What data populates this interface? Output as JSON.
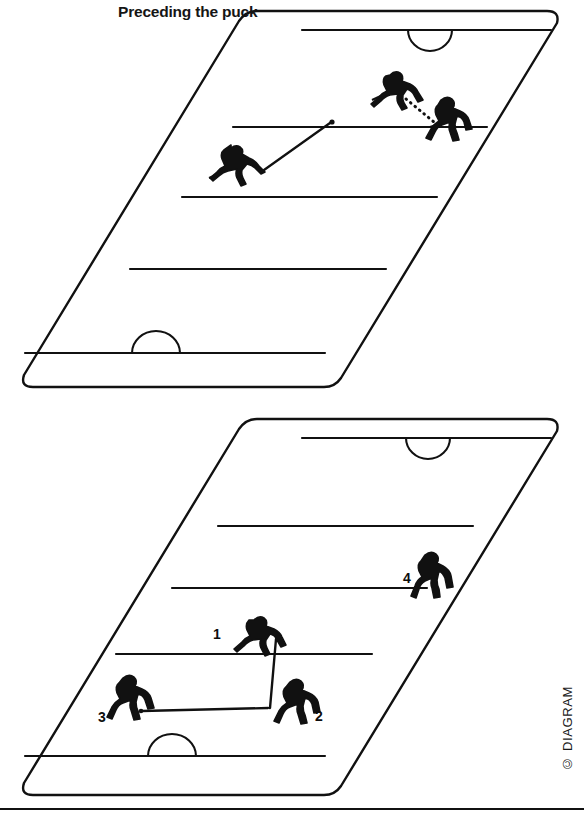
{
  "document": {
    "kind": "instructional-diagram",
    "subject": "ice hockey positional play",
    "background_color": "#ffffff",
    "ink_color": "#111111",
    "footer_rule": true
  },
  "panels": [
    {
      "id": "preceding",
      "title": "Preceding the puck",
      "rink": {
        "shape": "oblique-parallelogram",
        "corners": {
          "top_left": [
            300,
            12
          ],
          "top_right": [
            558,
            12
          ],
          "bottom_right": [
            330,
            386
          ],
          "bottom_left": [
            22,
            386
          ]
        },
        "lines": [
          {
            "name": "far-goal-line",
            "label": "goal line"
          },
          {
            "name": "far-blue-line",
            "label": "blue line"
          },
          {
            "name": "center-line",
            "label": "center line"
          },
          {
            "name": "near-blue-line",
            "label": "blue line"
          },
          {
            "name": "near-goal-line",
            "label": "goal line"
          }
        ],
        "creases": [
          {
            "name": "far-crease",
            "side": "far"
          },
          {
            "name": "near-crease",
            "side": "near"
          }
        ]
      },
      "players": [
        {
          "id": "carrier",
          "number": "",
          "role": "puck carrier with stick",
          "pass_type": "solid"
        },
        {
          "id": "forechecker",
          "number": "",
          "role": "skater preceding the puck",
          "pass_type": "dotted"
        },
        {
          "id": "defender",
          "number": "",
          "role": "opposing skater",
          "pass_type": "dotted"
        }
      ],
      "puck": {
        "visible": true,
        "label": "puck"
      },
      "paths": [
        {
          "name": "puck-path",
          "style": "solid",
          "from": "carrier",
          "to": "puck"
        },
        {
          "name": "skate-path",
          "style": "dotted",
          "from": "forechecker",
          "to": "defender"
        }
      ]
    },
    {
      "id": "advancing",
      "title": "Advancing the puck",
      "rink": {
        "shape": "oblique-parallelogram",
        "corners": {
          "top_left": [
            300,
            420
          ],
          "top_right": [
            558,
            420
          ],
          "bottom_right": [
            330,
            794
          ],
          "bottom_left": [
            22,
            794
          ]
        },
        "lines": [
          {
            "name": "far-goal-line",
            "label": "goal line"
          },
          {
            "name": "far-blue-line",
            "label": "blue line"
          },
          {
            "name": "center-line",
            "label": "center line"
          },
          {
            "name": "near-blue-line",
            "label": "blue line"
          },
          {
            "name": "near-goal-line",
            "label": "goal line"
          }
        ],
        "creases": [
          {
            "name": "far-crease",
            "side": "far"
          },
          {
            "name": "near-crease",
            "side": "near"
          }
        ]
      },
      "players": [
        {
          "id": "p1",
          "number": "1",
          "role": "skater at center line"
        },
        {
          "id": "p2",
          "number": "2",
          "role": "skater receiving pass"
        },
        {
          "id": "p3",
          "number": "3",
          "role": "puck carrier in own zone"
        },
        {
          "id": "p4",
          "number": "4",
          "role": "skater advancing up right wing"
        }
      ],
      "paths": [
        {
          "name": "pass-3-to-2",
          "style": "solid",
          "from": "p3",
          "to": "p2"
        },
        {
          "name": "pass-2-to-1",
          "style": "solid",
          "from": "p2",
          "to": "p1"
        }
      ]
    }
  ],
  "credit": {
    "text": "© DIAGRAM",
    "orientation": "vertical"
  }
}
